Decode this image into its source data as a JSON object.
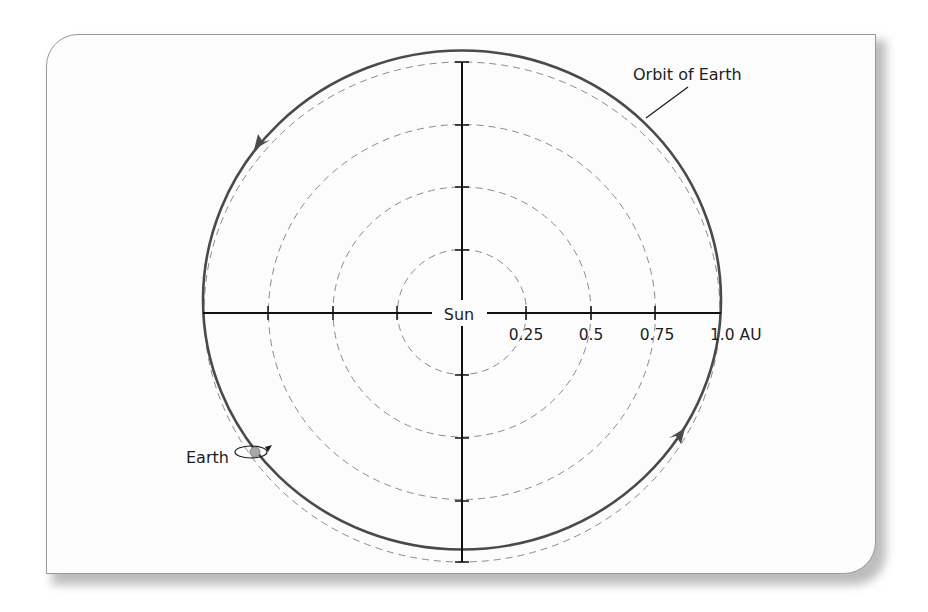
{
  "diagram": {
    "title_label": "Orbit of Earth",
    "center_label": "Sun",
    "planet_label": "Earth",
    "axis_ticks": [
      "0.25",
      "0.5",
      "0.75",
      "1.0 AU"
    ],
    "scale_radii_au": [
      0.25,
      0.5,
      0.75,
      1.0
    ],
    "orbit_direction": "counterclockwise",
    "colors": {
      "orbit": "#4a4a4a",
      "axes": "#111111",
      "dashed_circles": "#8a8a8a",
      "earth": "#a8a8a8",
      "card_border": "#9a9a9a"
    }
  }
}
